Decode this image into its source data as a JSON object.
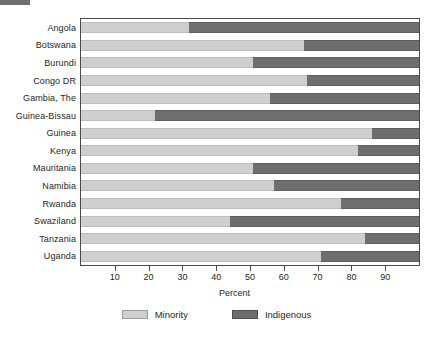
{
  "chart_data": {
    "type": "bar",
    "orientation": "horizontal",
    "stacked": true,
    "stack_total": 100,
    "title": "",
    "subtitle": "",
    "xlabel": "Percent",
    "ylabel": "",
    "xlim": [
      0,
      100
    ],
    "xticks": [
      10,
      20,
      30,
      40,
      50,
      60,
      70,
      80,
      90
    ],
    "xtick_labels": [
      "10",
      "20",
      "30",
      "40",
      "50",
      "60",
      "70",
      "80",
      "90"
    ],
    "grid": false,
    "legend_position": "bottom",
    "categories": [
      "Angola",
      "Botswana",
      "Burundi",
      "Congo DR",
      "Gambia, The",
      "Guinea-Bissau",
      "Guinea",
      "Kenya",
      "Mauritania",
      "Namibia",
      "Rwanda",
      "Swaziland",
      "Tanzania",
      "Uganda"
    ],
    "series": [
      {
        "name": "Minority",
        "color": "#cfcfcf",
        "values": [
          32,
          66,
          51,
          67,
          56,
          22,
          86,
          82,
          51,
          57,
          77,
          44,
          84,
          71
        ]
      },
      {
        "name": "Indigenous",
        "color": "#6e6e6e",
        "values": [
          68,
          34,
          49,
          33,
          44,
          78,
          14,
          18,
          49,
          43,
          23,
          56,
          16,
          29
        ]
      }
    ]
  },
  "legend": {
    "items": [
      {
        "label": "Minority",
        "swatch": "minority-swatch"
      },
      {
        "label": "Indigenous",
        "swatch": "indigenous-swatch"
      }
    ]
  }
}
